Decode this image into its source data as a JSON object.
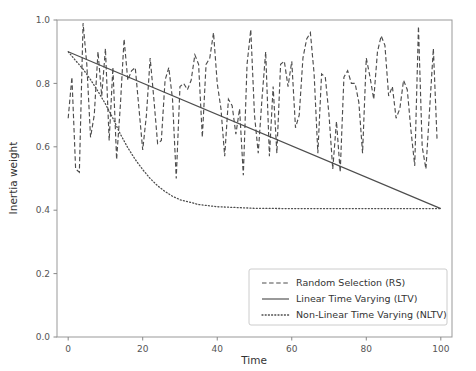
{
  "chart_data": {
    "type": "line",
    "title": "",
    "xlabel": "Time",
    "ylabel": "Inertia weight",
    "xlim": [
      -3,
      103
    ],
    "ylim": [
      0.0,
      1.0
    ],
    "xticks": [
      0,
      20,
      40,
      60,
      80,
      100
    ],
    "xtick_labels": [
      "0",
      "20",
      "40",
      "60",
      "80",
      "100"
    ],
    "yticks": [
      0.0,
      0.2,
      0.4,
      0.6,
      0.8,
      1.0
    ],
    "ytick_labels": [
      "0.0",
      "0.2",
      "0.4",
      "0.6",
      "0.8",
      "1.0"
    ],
    "grid": false,
    "legend_position": "lower right",
    "series": [
      {
        "name": "Random Selection (RS)",
        "style": "dashed",
        "color": "#4d4d4d",
        "x": [
          0,
          1,
          2,
          3,
          4,
          5,
          6,
          7,
          8,
          9,
          10,
          11,
          12,
          13,
          14,
          15,
          16,
          17,
          18,
          19,
          20,
          21,
          22,
          23,
          24,
          25,
          26,
          27,
          28,
          29,
          30,
          31,
          32,
          33,
          34,
          35,
          36,
          37,
          38,
          39,
          40,
          41,
          42,
          43,
          44,
          45,
          46,
          47,
          48,
          49,
          50,
          51,
          52,
          53,
          54,
          55,
          56,
          57,
          58,
          59,
          60,
          61,
          62,
          63,
          64,
          65,
          66,
          67,
          68,
          69,
          70,
          71,
          72,
          73,
          74,
          75,
          76,
          77,
          78,
          79,
          80,
          81,
          82,
          83,
          84,
          85,
          86,
          87,
          88,
          89,
          90,
          91,
          92,
          93,
          94,
          95,
          96,
          97,
          98,
          99
        ],
        "values": [
          0.69,
          0.82,
          0.53,
          0.52,
          0.99,
          0.86,
          0.63,
          0.7,
          0.9,
          0.76,
          0.91,
          0.62,
          0.85,
          0.56,
          0.73,
          0.94,
          0.81,
          0.84,
          0.85,
          0.72,
          0.59,
          0.7,
          0.88,
          0.75,
          0.61,
          0.62,
          0.81,
          0.85,
          0.75,
          0.5,
          0.79,
          0.8,
          0.78,
          0.81,
          0.89,
          0.86,
          0.63,
          0.86,
          0.88,
          0.96,
          0.8,
          0.72,
          0.57,
          0.75,
          0.73,
          0.64,
          0.72,
          0.51,
          0.86,
          0.97,
          0.7,
          0.58,
          0.75,
          0.9,
          0.57,
          0.79,
          0.58,
          0.86,
          0.87,
          0.79,
          0.87,
          0.66,
          0.7,
          0.88,
          0.94,
          0.96,
          0.83,
          0.58,
          0.83,
          0.82,
          0.7,
          0.53,
          0.68,
          0.52,
          0.82,
          0.84,
          0.8,
          0.8,
          0.74,
          0.58,
          0.88,
          0.82,
          0.75,
          0.9,
          0.95,
          0.92,
          0.76,
          0.79,
          0.69,
          0.72,
          0.81,
          0.78,
          0.65,
          0.54,
          0.98,
          0.6,
          0.53,
          0.72,
          0.91,
          0.62
        ]
      },
      {
        "name": "Linear Time Varying (LTV)",
        "style": "solid",
        "color": "#4d4d4d",
        "x": [
          0,
          100
        ],
        "values": [
          0.9,
          0.405
        ]
      },
      {
        "name": "Non-Linear Time Varying (NLTV)",
        "style": "dotted",
        "color": "#4d4d4d",
        "formula_note": "exponential decay from 0.9 to asymptote 0.405",
        "x": [
          0,
          2,
          4,
          6,
          8,
          10,
          12,
          14,
          16,
          18,
          20,
          22,
          24,
          26,
          28,
          30,
          35,
          40,
          50,
          60,
          70,
          80,
          90,
          100
        ],
        "values": [
          0.9,
          0.872,
          0.845,
          0.812,
          0.775,
          0.735,
          0.69,
          0.64,
          0.597,
          0.56,
          0.528,
          0.5,
          0.477,
          0.459,
          0.444,
          0.433,
          0.418,
          0.411,
          0.406,
          0.405,
          0.405,
          0.405,
          0.405,
          0.405
        ]
      }
    ]
  },
  "axes": {
    "xlabel": "Time",
    "ylabel": "Inertia weight"
  },
  "legend": {
    "items": [
      {
        "label": "Random Selection (RS)",
        "style": "dashed"
      },
      {
        "label": "Linear Time Varying (LTV)",
        "style": "solid"
      },
      {
        "label": "Non-Linear Time Varying (NLTV)",
        "style": "dotted"
      }
    ]
  },
  "colors": {
    "line": "#4d4d4d",
    "axis": "#888888",
    "text": "#333333",
    "tick_text": "#555555",
    "background": "#ffffff"
  }
}
